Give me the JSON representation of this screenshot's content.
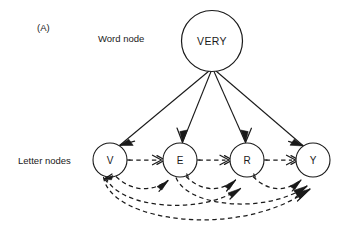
{
  "figure": {
    "panel_label": "(A)",
    "caption_labels": {
      "word_row": "Word node",
      "letter_row": "Letter nodes"
    }
  },
  "word_node": {
    "id": "word-very",
    "label": "VERY",
    "cx": 212,
    "cy": 41,
    "r": 30.5
  },
  "letter_nodes": [
    {
      "id": "letter-v",
      "label": "V",
      "cx": 110,
      "cy": 160,
      "r": 17
    },
    {
      "id": "letter-e",
      "label": "E",
      "cx": 180,
      "cy": 160,
      "r": 17
    },
    {
      "id": "letter-r",
      "label": "R",
      "cx": 247,
      "cy": 160,
      "r": 17
    },
    {
      "id": "letter-y",
      "label": "Y",
      "cx": 313,
      "cy": 160,
      "r": 17
    }
  ],
  "top_down_links": [
    {
      "id": "very-to-v",
      "from": "VERY",
      "to": "V",
      "style": "solid",
      "direction": "down"
    },
    {
      "id": "very-to-e",
      "from": "VERY",
      "to": "E",
      "style": "solid",
      "direction": "down"
    },
    {
      "id": "very-to-r",
      "from": "VERY",
      "to": "R",
      "style": "solid",
      "direction": "down"
    },
    {
      "id": "very-to-y",
      "from": "VERY",
      "to": "Y",
      "style": "solid",
      "direction": "down"
    }
  ],
  "lateral_links": [
    {
      "id": "v-to-e",
      "from": "V",
      "to": "E",
      "style": "dashed",
      "shape": "straight"
    },
    {
      "id": "e-to-r",
      "from": "E",
      "to": "R",
      "style": "dashed",
      "shape": "straight"
    },
    {
      "id": "r-to-y",
      "from": "R",
      "to": "Y",
      "style": "dashed",
      "shape": "straight"
    },
    {
      "id": "v-to-e-curve",
      "from": "V",
      "to": "E",
      "style": "dashed",
      "shape": "curve"
    },
    {
      "id": "e-to-r-curve",
      "from": "E",
      "to": "R",
      "style": "dashed",
      "shape": "curve"
    },
    {
      "id": "r-to-y-curve",
      "from": "R",
      "to": "Y",
      "style": "dashed",
      "shape": "curve"
    },
    {
      "id": "v-to-r-curve",
      "from": "V",
      "to": "R",
      "style": "dashed",
      "shape": "curve"
    },
    {
      "id": "e-to-y-curve",
      "from": "E",
      "to": "Y",
      "style": "dashed",
      "shape": "curve"
    },
    {
      "id": "v-to-y-curve",
      "from": "V",
      "to": "Y",
      "style": "dashed",
      "shape": "curve"
    }
  ],
  "colors": {
    "background": "#ffffff",
    "stroke": "#1a1a1a",
    "text": "#1a1a1a"
  }
}
